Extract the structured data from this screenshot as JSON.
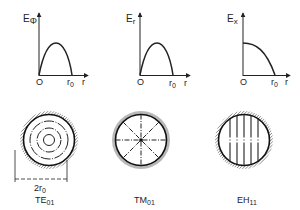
{
  "figure": {
    "plots": [
      {
        "id": "te01-plot",
        "ylabel_main": "E",
        "ylabel_sub": "Φ",
        "origin_label": "O",
        "r0_main": "r",
        "r0_sub": "0",
        "xlabel": "r",
        "curve": "half-sine rising from 0 at origin, peak mid-radius, 0 at r0"
      },
      {
        "id": "tm01-plot",
        "ylabel_main": "E",
        "ylabel_sub": "r",
        "origin_label": "O",
        "r0_main": "r",
        "r0_sub": "0",
        "xlabel": "r",
        "curve": "half-sine rising from 0 at origin, peak mid-radius, 0 at r0"
      },
      {
        "id": "eh11-plot",
        "ylabel_main": "E",
        "ylabel_sub": "x",
        "origin_label": "O",
        "r0_main": "r",
        "r0_sub": "0",
        "xlabel": "r",
        "curve": "maximum at origin, decreasing to 0 at r0"
      }
    ],
    "modes": [
      {
        "id": "te01",
        "name_main": "TE",
        "name_sub": "01",
        "pattern": "concentric circles",
        "dimension_main": "2r",
        "dimension_sub": "0"
      },
      {
        "id": "tm01",
        "name_main": "TM",
        "name_sub": "01",
        "pattern": "radial lines"
      },
      {
        "id": "eh11",
        "name_main": "EH",
        "name_sub": "11",
        "pattern": "parallel vertical lines"
      }
    ]
  }
}
